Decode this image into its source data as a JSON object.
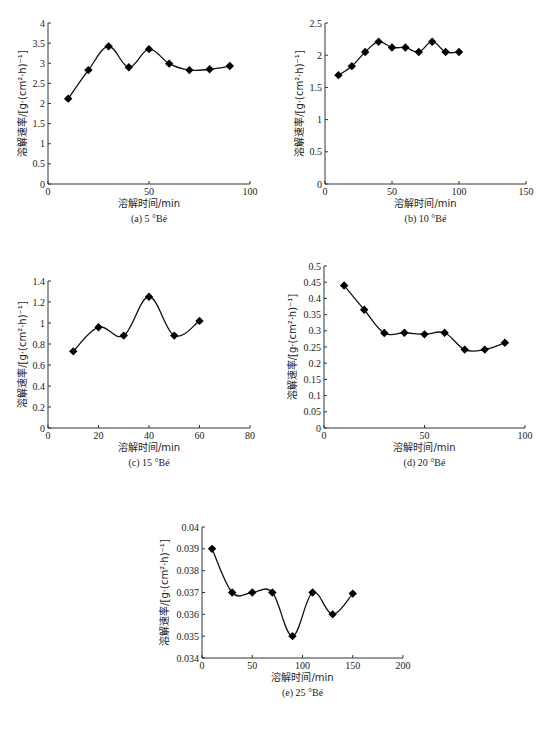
{
  "figure": {
    "x_axis_label": "溶解时间/min",
    "y_axis_label": "溶解速率/[g·(cm²·h)⁻¹]",
    "caption": ""
  },
  "chart_data": [
    {
      "id": "a",
      "type": "line",
      "title": "(a) 5 °Bé",
      "xlabel": "溶解时间/min",
      "ylabel": "溶解速率/[g·(cm²·h)⁻¹]",
      "xlim": [
        0,
        100
      ],
      "ylim": [
        0,
        4
      ],
      "xticks": [
        0,
        50,
        100
      ],
      "yticks": [
        0,
        0.5,
        1,
        1.5,
        2,
        2.5,
        3,
        3.5,
        4
      ],
      "grid": false,
      "marker": "diamond",
      "x": [
        10,
        20,
        30,
        40,
        50,
        60,
        70,
        80,
        90
      ],
      "values": [
        2.12,
        2.83,
        3.42,
        2.9,
        3.35,
        2.99,
        2.83,
        2.85,
        2.93
      ]
    },
    {
      "id": "b",
      "type": "line",
      "title": "(b) 10 °Bé",
      "xlabel": "溶解时间/min",
      "ylabel": "溶解速率/[g·(cm²·h)⁻¹]",
      "xlim": [
        0,
        150
      ],
      "ylim": [
        0,
        2.5
      ],
      "xticks": [
        0,
        50,
        100,
        150
      ],
      "yticks": [
        0,
        0.5,
        1,
        1.5,
        2,
        2.5
      ],
      "grid": false,
      "marker": "diamond",
      "x": [
        10,
        20,
        30,
        40,
        50,
        60,
        70,
        80,
        90,
        100
      ],
      "values": [
        1.69,
        1.83,
        2.05,
        2.21,
        2.12,
        2.12,
        2.05,
        2.21,
        2.05,
        2.05
      ]
    },
    {
      "id": "c",
      "type": "line",
      "title": "(c) 15 °Bé",
      "xlabel": "溶解时间/min",
      "ylabel": "溶解速率/[g·(cm²·h)⁻¹]",
      "xlim": [
        0,
        80
      ],
      "ylim": [
        0,
        1.4
      ],
      "xticks": [
        0,
        20,
        40,
        60,
        80
      ],
      "yticks": [
        0,
        0.2,
        0.4,
        0.6,
        0.8,
        1,
        1.2,
        1.4
      ],
      "grid": false,
      "marker": "diamond",
      "x": [
        10,
        20,
        30,
        40,
        50,
        60
      ],
      "values": [
        0.73,
        0.96,
        0.88,
        1.25,
        0.88,
        1.02
      ]
    },
    {
      "id": "d",
      "type": "line",
      "title": "(d) 20 °Bé",
      "xlabel": "溶解时间/min",
      "ylabel": "溶解速率/[g·(cm²·h)⁻¹]",
      "xlim": [
        0,
        100
      ],
      "ylim": [
        0,
        0.5
      ],
      "xticks": [
        0,
        50,
        100
      ],
      "yticks": [
        0,
        0.05,
        0.1,
        0.15,
        0.2,
        0.25,
        0.3,
        0.35,
        0.4,
        0.45,
        0.5
      ],
      "grid": false,
      "marker": "diamond",
      "x": [
        10,
        20,
        30,
        40,
        50,
        60,
        70,
        80,
        90
      ],
      "values": [
        0.44,
        0.365,
        0.293,
        0.294,
        0.289,
        0.294,
        0.242,
        0.242,
        0.263
      ]
    },
    {
      "id": "e",
      "type": "line",
      "title": "(e) 25 °Bé",
      "xlabel": "溶解时间/min",
      "ylabel": "溶解速率/[g·(cm²·h)⁻¹]",
      "xlim": [
        0,
        200
      ],
      "ylim": [
        0.034,
        0.04
      ],
      "xticks": [
        0,
        50,
        100,
        150,
        200
      ],
      "yticks": [
        0.034,
        0.035,
        0.036,
        0.037,
        0.038,
        0.039,
        0.04
      ],
      "grid": false,
      "marker": "diamond",
      "x": [
        10,
        30,
        50,
        70,
        90,
        110,
        130,
        150
      ],
      "values": [
        0.039,
        0.037,
        0.037,
        0.037,
        0.035,
        0.037,
        0.036,
        0.03695
      ]
    }
  ],
  "layout": {
    "panels": {
      "a": {
        "x0": 48,
        "x1": 250,
        "y0": 184,
        "y1": 23
      },
      "b": {
        "x0": 325,
        "x1": 526,
        "y0": 184,
        "y1": 23
      },
      "c": {
        "x0": 48,
        "x1": 250,
        "y0": 428,
        "y1": 281
      },
      "d": {
        "x0": 324,
        "x1": 525,
        "y0": 428,
        "y1": 266
      },
      "e": {
        "x0": 202,
        "x1": 403,
        "y0": 658,
        "y1": 527
      }
    },
    "ytick_decimals": {
      "a": 1,
      "b": 1,
      "c": 1,
      "d": 2,
      "e": 3
    }
  }
}
